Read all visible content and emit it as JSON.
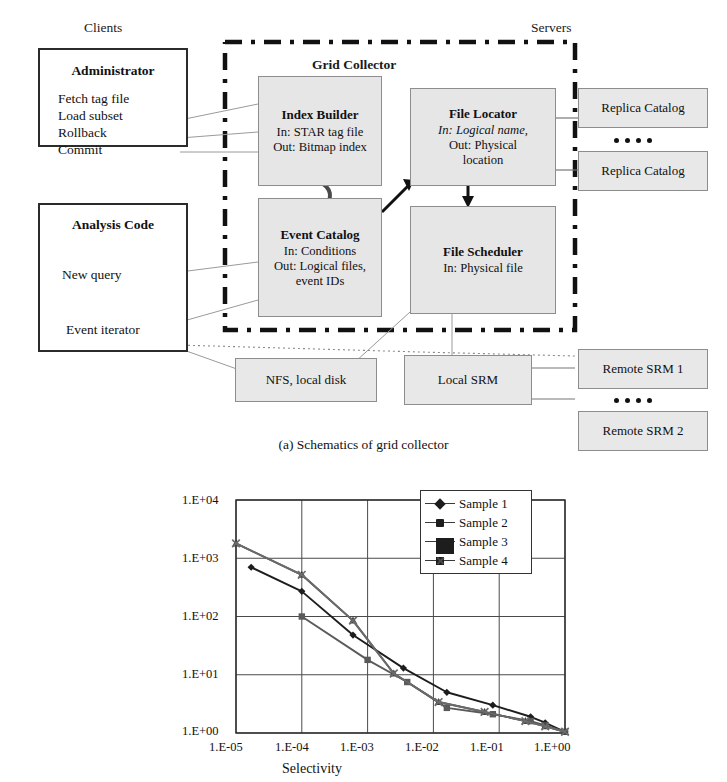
{
  "figure_a": {
    "caption": "(a) Schematics of grid collector",
    "side_labels": {
      "left": "Clients",
      "right": "Servers"
    },
    "boundary_label": "Grid Collector",
    "clients": [
      {
        "title": "Administrator",
        "lines": [
          "Fetch tag file",
          "Load subset",
          "Rollback",
          "Commit"
        ]
      },
      {
        "title": "Analysis Code",
        "lines": [
          "New query"
        ],
        "footer": "Event iterator"
      }
    ],
    "components": [
      {
        "title": "Index Builder",
        "lines": [
          "In: STAR tag file",
          "Out: Bitmap index"
        ]
      },
      {
        "title": "File Locator",
        "lines": [
          "In: Logical name,",
          "Out: Physical",
          "location"
        ],
        "italic_line_index": 0
      },
      {
        "title": "Event Catalog",
        "lines": [
          "In: Conditions",
          "Out: Logical files,",
          "event IDs"
        ]
      },
      {
        "title": "File Scheduler",
        "lines": [
          "In: Physical file"
        ]
      }
    ],
    "servers": [
      {
        "label": "Replica Catalog"
      },
      {
        "label": "Replica Catalog"
      },
      {
        "label": "Remote SRM 1"
      },
      {
        "label": "Remote SRM 2"
      }
    ],
    "storage": [
      {
        "label": "NFS, local disk"
      },
      {
        "label": "Local SRM"
      }
    ],
    "ellipsis_dots": 4,
    "colors": {
      "component_fill": "#e6e6e6",
      "server_fill": "#e8e8e8",
      "border": "#8d8d8d",
      "client_border": "#2b2b2b",
      "boundary": "#111111"
    }
  },
  "chart_data": {
    "type": "line",
    "title": "",
    "xlabel": "Selectivity",
    "ylabel": "Speedup",
    "xscale": "log",
    "yscale": "log",
    "xlim": [
      1e-05,
      1.0
    ],
    "ylim": [
      1.0,
      10000.0
    ],
    "xticklabels": [
      "1.E-05",
      "1.E-04",
      "1.E-03",
      "1.E-02",
      "1.E-01",
      "1.E+00"
    ],
    "yticklabels": [
      "1.E+00",
      "1.E+01",
      "1.E+02",
      "1.E+03",
      "1.E+04"
    ],
    "grid": true,
    "legend_position": "upper-right",
    "series": [
      {
        "name": "Sample 1",
        "marker": "diamond",
        "color": "#1d1d1d",
        "points": [
          [
            1.7e-05,
            700
          ],
          [
            0.0001,
            270
          ],
          [
            0.0006,
            48
          ],
          [
            0.0035,
            13
          ],
          [
            0.016,
            5.0
          ],
          [
            0.08,
            3.0
          ],
          [
            0.3,
            1.9
          ],
          [
            0.5,
            1.5
          ],
          [
            1.0,
            1.05
          ]
        ]
      },
      {
        "name": "Sample 2",
        "marker": "square",
        "color": "#5a5a5a",
        "points": [
          [
            0.0001,
            100
          ],
          [
            0.001,
            18
          ],
          [
            0.004,
            7.5
          ],
          [
            0.016,
            2.7
          ],
          [
            0.08,
            2.1
          ],
          [
            0.3,
            1.6
          ],
          [
            0.5,
            1.35
          ],
          [
            1.0,
            1.05
          ]
        ]
      },
      {
        "name": "Sample 3",
        "marker": "triangle",
        "color": "#3f3f3f",
        "points": [
          [
            1e-05,
            1800
          ],
          [
            0.0001,
            520
          ],
          [
            0.0006,
            85
          ],
          [
            0.0025,
            10.5
          ],
          [
            0.012,
            3.4
          ],
          [
            0.06,
            2.3
          ],
          [
            0.25,
            1.6
          ],
          [
            0.5,
            1.3
          ],
          [
            1.0,
            1.05
          ]
        ]
      },
      {
        "name": "Sample 4",
        "marker": "x",
        "color": "#6b6b6b",
        "points": [
          [
            1e-05,
            1800
          ],
          [
            0.0001,
            520
          ],
          [
            0.0006,
            85
          ],
          [
            0.0025,
            10.5
          ],
          [
            0.012,
            3.4
          ],
          [
            0.06,
            2.3
          ],
          [
            0.25,
            1.6
          ],
          [
            0.5,
            1.3
          ],
          [
            1.0,
            1.05
          ]
        ]
      }
    ],
    "legend_entries": [
      "Sample 1",
      "Sample 2",
      "Sample 3",
      "Sample 4"
    ]
  }
}
